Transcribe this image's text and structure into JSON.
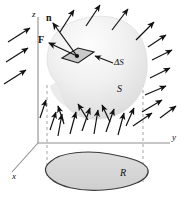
{
  "figure": {
    "width": 182,
    "height": 205,
    "background": "#ffffff"
  },
  "colors": {
    "ink": "#111111",
    "axis": "#888888",
    "dashed": "#9a9a9a",
    "surface_light": "#fbfbfb",
    "surface_mid": "#ececec",
    "surface_dark": "#d5d5d5",
    "region_fill": "#d8d8d8",
    "region_stroke": "#3a3a3a",
    "patch_fill": "#c9c9c9",
    "patch_stroke": "#1a1a1a",
    "arrow": "#111111"
  },
  "labels": {
    "axis_z": "z",
    "axis_y": "y",
    "axis_x": "x",
    "normal_vector": "n",
    "field_vector": "F",
    "patch": "ΔS",
    "surface": "S",
    "region": "R"
  },
  "geometry": {
    "origin": {
      "x": 38,
      "y": 143
    },
    "z_axis": {
      "x1": 38,
      "y1": 17,
      "x2": 38,
      "y2": 143
    },
    "y_axis": {
      "x1": 38,
      "y1": 143,
      "x2": 170,
      "y2": 143
    },
    "x_axis": {
      "x1": 38,
      "y1": 143,
      "x2": 12,
      "y2": 172
    },
    "dashed_left": {
      "x": 47,
      "y1": 85,
      "y2": 176
    },
    "dashed_right": {
      "x": 143,
      "y1": 72,
      "y2": 182
    },
    "patch_center": {
      "x": 76,
      "y": 55
    },
    "normal_tip": {
      "x": 52,
      "y": 22
    },
    "field_tip": {
      "x": 48,
      "y": 42
    }
  },
  "chart_data": {
    "type": "diagram",
    "elements": [
      {
        "name": "coordinate-axes",
        "items": [
          "z",
          "y",
          "x"
        ]
      },
      {
        "name": "surface",
        "label": "S"
      },
      {
        "name": "surface-element",
        "label": "ΔS"
      },
      {
        "name": "normal-vector",
        "label": "n"
      },
      {
        "name": "field-vector",
        "label": "F"
      },
      {
        "name": "projected-region",
        "label": "R"
      }
    ],
    "arrow_count": 26
  },
  "arrows": [
    {
      "x1": 8,
      "y1": 42,
      "x2": 30,
      "y2": 28
    },
    {
      "x1": 6,
      "y1": 62,
      "x2": 28,
      "y2": 48
    },
    {
      "x1": 4,
      "y1": 84,
      "x2": 26,
      "y2": 70
    },
    {
      "x1": 60,
      "y1": 32,
      "x2": 74,
      "y2": 10
    },
    {
      "x1": 86,
      "y1": 26,
      "x2": 100,
      "y2": 5
    },
    {
      "x1": 112,
      "y1": 30,
      "x2": 128,
      "y2": 9
    },
    {
      "x1": 136,
      "y1": 40,
      "x2": 154,
      "y2": 22
    },
    {
      "x1": 152,
      "y1": 60,
      "x2": 172,
      "y2": 50
    },
    {
      "x1": 148,
      "y1": 47,
      "x2": 166,
      "y2": 35
    },
    {
      "x1": 150,
      "y1": 78,
      "x2": 170,
      "y2": 68
    },
    {
      "x1": 145,
      "y1": 95,
      "x2": 166,
      "y2": 86
    },
    {
      "x1": 142,
      "y1": 112,
      "x2": 162,
      "y2": 100
    },
    {
      "x1": 133,
      "y1": 126,
      "x2": 152,
      "y2": 113
    },
    {
      "x1": 58,
      "y1": 136,
      "x2": 62,
      "y2": 114
    },
    {
      "x1": 70,
      "y1": 134,
      "x2": 76,
      "y2": 112
    },
    {
      "x1": 82,
      "y1": 131,
      "x2": 90,
      "y2": 108
    },
    {
      "x1": 94,
      "y1": 134,
      "x2": 98,
      "y2": 110
    },
    {
      "x1": 106,
      "y1": 132,
      "x2": 114,
      "y2": 109
    },
    {
      "x1": 118,
      "y1": 135,
      "x2": 124,
      "y2": 113
    },
    {
      "x1": 50,
      "y1": 130,
      "x2": 56,
      "y2": 112
    },
    {
      "x1": 88,
      "y1": 120,
      "x2": 78,
      "y2": 104
    },
    {
      "x1": 110,
      "y1": 122,
      "x2": 102,
      "y2": 105
    },
    {
      "x1": 64,
      "y1": 124,
      "x2": 58,
      "y2": 106
    },
    {
      "x1": 126,
      "y1": 126,
      "x2": 134,
      "y2": 108
    },
    {
      "x1": 40,
      "y1": 118,
      "x2": 46,
      "y2": 100
    },
    {
      "x1": 160,
      "y1": 118,
      "x2": 176,
      "y2": 106
    }
  ]
}
